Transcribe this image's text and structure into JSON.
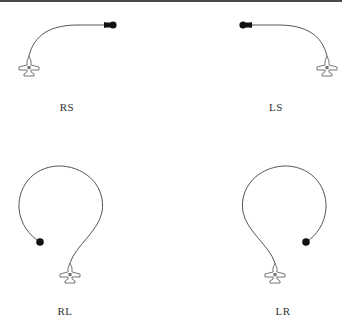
{
  "figure": {
    "colors": {
      "line": "#555555",
      "marker": "#111111",
      "aircraft_fill": "#ffffff",
      "aircraft_stroke": "#666666",
      "aircraft_center": "#777777"
    },
    "panels": [
      {
        "id": "rs",
        "label": "RS",
        "label_pos": [
          67,
          102
        ],
        "aircraft": [
          29,
          66
        ],
        "endpoint": [
          113,
          25
        ],
        "endpoint_style": "dot-with-arrow-left"
      },
      {
        "id": "ls",
        "label": "LS",
        "label_pos": [
          276,
          102
        ],
        "aircraft": [
          327,
          66
        ],
        "endpoint": [
          243,
          25
        ],
        "endpoint_style": "dot-with-arrow-right"
      },
      {
        "id": "rl",
        "label": "RL",
        "label_pos": [
          65,
          306
        ],
        "aircraft": [
          70,
          273
        ],
        "endpoint": [
          40,
          242
        ],
        "endpoint_style": "dot"
      },
      {
        "id": "lr",
        "label": "LR",
        "label_pos": [
          283,
          306
        ],
        "aircraft": [
          275,
          273
        ],
        "endpoint": [
          306,
          242
        ],
        "endpoint_style": "dot"
      }
    ]
  }
}
